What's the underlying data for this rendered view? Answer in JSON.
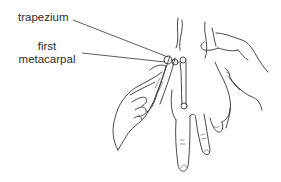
{
  "figure": {
    "labels": [
      {
        "id": "trapezium",
        "text": "trapezium"
      },
      {
        "id": "first_metacarpal",
        "lines": [
          "first",
          "metacarpal"
        ]
      }
    ],
    "colors": {
      "ink": "#333333",
      "background": "#ffffff"
    }
  }
}
